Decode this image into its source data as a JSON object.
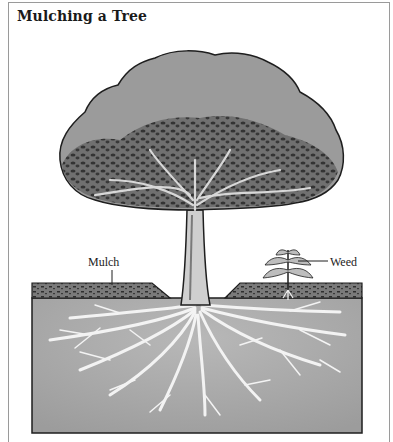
{
  "title": "Mulching a Tree",
  "labels": {
    "mulch": "Mulch",
    "weed": "Weed"
  },
  "illustration": {
    "subject": "tree with mulch ring and root system",
    "elements": [
      "canopy",
      "trunk",
      "mulch-layer",
      "soil-cross-section",
      "root-system",
      "weed"
    ],
    "colors": {
      "canopy": "#9b9b9b",
      "foliage_dark": "#3a3a3a",
      "soil": "#a9a9a9",
      "mulch": "#5a5a5a",
      "roots": "#f2f2f2",
      "outline": "#1e1e1e"
    }
  }
}
